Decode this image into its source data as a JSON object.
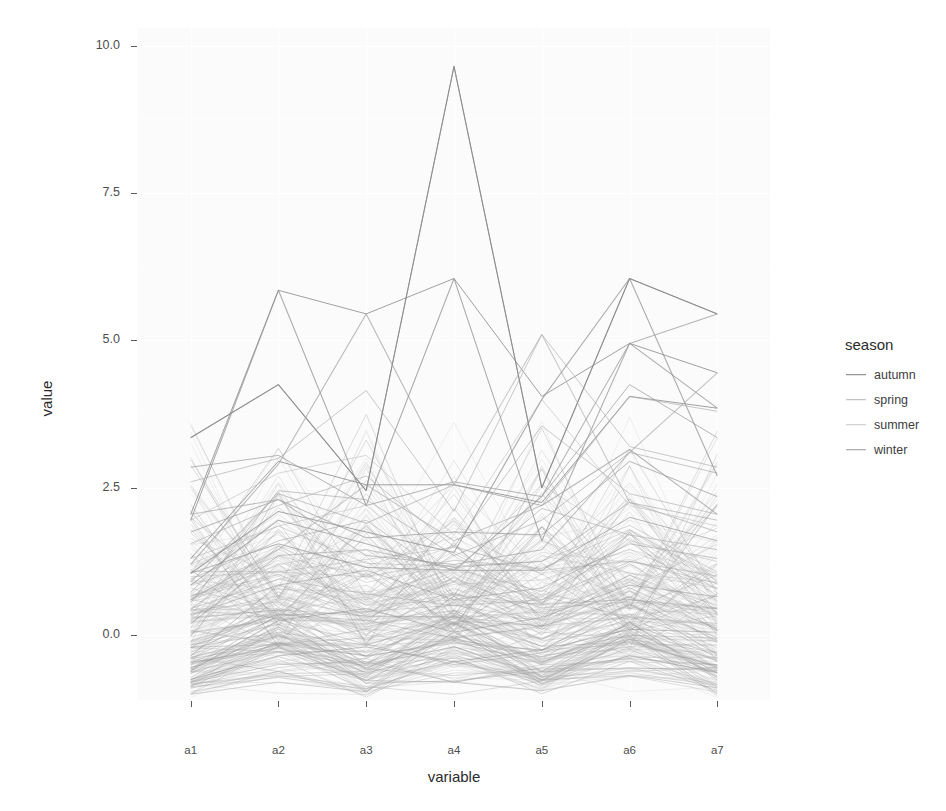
{
  "chart_data": {
    "type": "line",
    "subtype": "parallel-coordinates",
    "title": "",
    "xlabel": "variable",
    "ylabel": "value",
    "categories": [
      "a1",
      "a2",
      "a3",
      "a4",
      "a5",
      "a6",
      "a7"
    ],
    "x_tick_labels": [
      "a1",
      "a2",
      "a3",
      "a4",
      "a5",
      "a6",
      "a7"
    ],
    "y_tick_labels": [
      "0.0",
      "2.5",
      "5.0",
      "7.5",
      "10.0"
    ],
    "y_tick_values": [
      0.0,
      2.5,
      5.0,
      7.5,
      10.0
    ],
    "ylim": [
      -1.1,
      10.3
    ],
    "grid": "major-and-minor-white",
    "legend_position": "right",
    "legend_title": "season",
    "legend_entries": [
      "autumn",
      "spring",
      "summer",
      "winter"
    ],
    "legend_colors": [
      "#7d7d7d",
      "#b4b4b4",
      "#c8c8c8",
      "#9a9a9a"
    ],
    "panel_background": "#fbfbfc",
    "line_alpha": 0.45,
    "note": "Heavily overplotted parallel-coordinate lines; ~200 series across 7 axes.",
    "series": [
      {
        "name": "autumn",
        "color": "#7d7d7d",
        "values_sets": [
          [
            3.35,
            4.25,
            2.45,
            9.65,
            2.5,
            6.05,
            5.45
          ],
          [
            2.05,
            5.85,
            5.45,
            6.05,
            4.05,
            4.95,
            4.45
          ],
          [
            1.3,
            2.95,
            2.55,
            2.55,
            2.25,
            4.05,
            3.85
          ],
          [
            0.55,
            2.45,
            2.3,
            1.35,
            1.95,
            3.1,
            2.75
          ],
          [
            0.2,
            1.35,
            1.45,
            1.15,
            1.25,
            2.25,
            1.95
          ],
          [
            -0.35,
            0.85,
            1.1,
            0.6,
            0.8,
            1.55,
            1.3
          ],
          [
            -0.6,
            0.25,
            0.45,
            0.05,
            0.3,
            0.85,
            0.65
          ],
          [
            -0.75,
            -0.35,
            -0.2,
            -0.45,
            -0.25,
            0.1,
            0.05
          ]
        ]
      },
      {
        "name": "spring",
        "color": "#b4b4b4",
        "values_sets": [
          [
            2.6,
            3.0,
            4.15,
            2.1,
            5.1,
            3.2,
            2.85
          ],
          [
            1.55,
            2.2,
            2.7,
            1.5,
            3.55,
            2.4,
            2.05
          ],
          [
            0.95,
            1.6,
            1.95,
            0.9,
            2.15,
            1.7,
            1.45
          ],
          [
            0.35,
            0.95,
            1.25,
            0.35,
            1.35,
            1.05,
            0.9
          ],
          [
            -0.2,
            0.4,
            0.65,
            -0.1,
            0.7,
            0.45,
            0.35
          ],
          [
            -0.65,
            -0.15,
            0.1,
            -0.55,
            0.05,
            -0.05,
            -0.1
          ],
          [
            -0.85,
            -0.55,
            -0.4,
            -0.8,
            -0.5,
            -0.45,
            -0.5
          ]
        ]
      },
      {
        "name": "summer",
        "color": "#c8c8c8",
        "values_sets": [
          [
            1.95,
            2.75,
            3.05,
            1.7,
            4.0,
            2.2,
            1.85
          ],
          [
            1.2,
            1.85,
            2.2,
            1.05,
            2.55,
            1.6,
            1.25
          ],
          [
            0.6,
            1.2,
            1.45,
            0.55,
            1.6,
            1.05,
            0.8
          ],
          [
            0.05,
            0.6,
            0.85,
            0.05,
            0.9,
            0.55,
            0.4
          ],
          [
            -0.4,
            0.05,
            0.3,
            -0.4,
            0.25,
            0.05,
            0.0
          ],
          [
            -0.8,
            -0.45,
            -0.25,
            -0.75,
            -0.4,
            -0.35,
            -0.45
          ]
        ]
      },
      {
        "name": "winter",
        "color": "#9a9a9a",
        "values_sets": [
          [
            2.85,
            3.05,
            2.2,
            2.6,
            2.35,
            4.25,
            3.35
          ],
          [
            1.75,
            2.3,
            1.65,
            1.75,
            1.7,
            2.95,
            2.35
          ],
          [
            1.05,
            1.55,
            1.15,
            1.1,
            1.1,
            2.0,
            1.6
          ],
          [
            0.45,
            0.95,
            0.7,
            0.5,
            0.6,
            1.25,
            1.0
          ],
          [
            -0.1,
            0.35,
            0.25,
            -0.05,
            0.15,
            0.6,
            0.45
          ],
          [
            -0.55,
            -0.15,
            -0.15,
            -0.5,
            -0.3,
            0.0,
            -0.05
          ],
          [
            -0.8,
            -0.5,
            -0.45,
            -0.8,
            -0.55,
            -0.4,
            -0.5
          ]
        ]
      }
    ]
  },
  "axes": {
    "y_label": "value",
    "x_label": "variable",
    "y_ticks": [
      {
        "label": "0.0",
        "value": 0.0
      },
      {
        "label": "2.5",
        "value": 2.5
      },
      {
        "label": "5.0",
        "value": 5.0
      },
      {
        "label": "7.5",
        "value": 7.5
      },
      {
        "label": "10.0",
        "value": 10.0
      }
    ],
    "x_ticks": [
      {
        "label": "a1"
      },
      {
        "label": "a2"
      },
      {
        "label": "a3"
      },
      {
        "label": "a4"
      },
      {
        "label": "a5"
      },
      {
        "label": "a6"
      },
      {
        "label": "a7"
      }
    ]
  },
  "legend": {
    "title": "season",
    "items": [
      {
        "label": "autumn",
        "color": "#7d7d7d"
      },
      {
        "label": "spring",
        "color": "#b4b4b4"
      },
      {
        "label": "summer",
        "color": "#c8c8c8"
      },
      {
        "label": "winter",
        "color": "#9a9a9a"
      }
    ]
  }
}
